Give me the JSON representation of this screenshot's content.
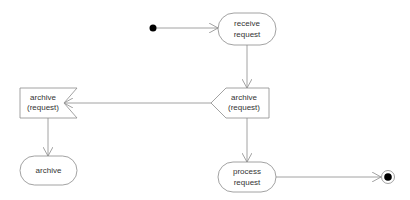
{
  "diagram": {
    "type": "uml-activity",
    "colors": {
      "stroke": "#8a8a8a",
      "text": "#333333",
      "fill": "#ffffff",
      "node": "#000000"
    },
    "nodes": [
      {
        "id": "initial",
        "kind": "initial-node"
      },
      {
        "id": "receive",
        "kind": "action",
        "lines": [
          "receive",
          "request"
        ]
      },
      {
        "id": "send",
        "kind": "send-signal",
        "lines": [
          "archive",
          "(request)"
        ]
      },
      {
        "id": "accept",
        "kind": "accept-event",
        "lines": [
          "archive",
          "(request)"
        ]
      },
      {
        "id": "archive",
        "kind": "action",
        "lines": [
          "archive"
        ]
      },
      {
        "id": "process",
        "kind": "action",
        "lines": [
          "process",
          "request"
        ]
      },
      {
        "id": "final",
        "kind": "final-node"
      }
    ],
    "edges": [
      {
        "from": "initial",
        "to": "receive"
      },
      {
        "from": "receive",
        "to": "send"
      },
      {
        "from": "send",
        "to": "accept"
      },
      {
        "from": "accept",
        "to": "archive"
      },
      {
        "from": "send",
        "to": "process"
      },
      {
        "from": "process",
        "to": "final"
      }
    ]
  }
}
